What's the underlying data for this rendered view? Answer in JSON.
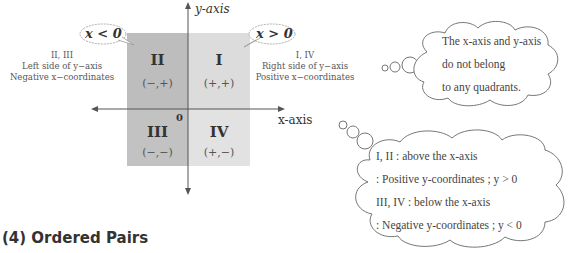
{
  "diagram": {
    "axes": {
      "y_label": "y-axis",
      "x_label": "x-axis",
      "origin": "0"
    },
    "quadrants": [
      {
        "id": "I",
        "label": "I",
        "sign": "(+,+)",
        "color": "#dcdcdc"
      },
      {
        "id": "II",
        "label": "II",
        "sign": "(−,+)",
        "color": "#bdbdbd"
      },
      {
        "id": "III",
        "label": "III",
        "sign": "(−,−)",
        "color": "#c2c2c2"
      },
      {
        "id": "IV",
        "label": "IV",
        "sign": "(+,−)",
        "color": "#e2e2e2"
      }
    ],
    "callouts": {
      "left": "x < 0",
      "right": "x > 0"
    },
    "side_notes": {
      "left": {
        "line1": "II, III",
        "line2": "Left side of y−axis",
        "line3": "Negative x−coordinates"
      },
      "right": {
        "line1": "I, IV",
        "line2": "Right side of y−axis",
        "line3": "Positive x−coordinates"
      }
    }
  },
  "clouds": {
    "top": {
      "line1": "The x-axis and y-axis",
      "line2": "do not belong",
      "line3": "to any quadrants."
    },
    "bottom": {
      "line1": "I, II : above the x-axis",
      "line2": ": Positive y-coordinates ;  y > 0",
      "line3": "III, IV : below the x-axis",
      "line4": ": Negative y-coordinates ;  y < 0"
    }
  },
  "section": {
    "heading": "(4) Ordered Pairs"
  }
}
